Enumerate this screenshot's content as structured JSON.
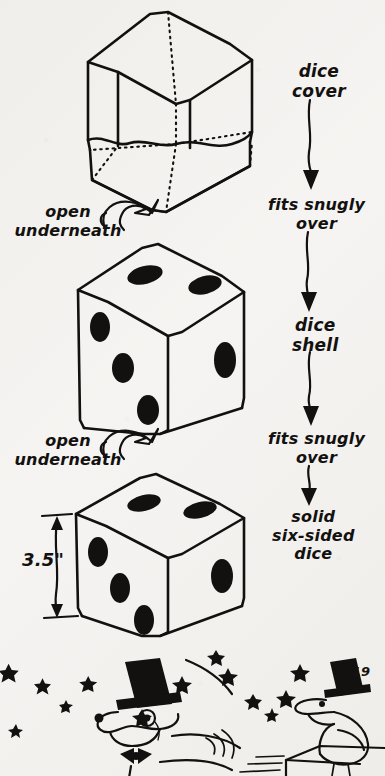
{
  "page": {
    "number": "19",
    "paper_color": "#f3f1ee",
    "ink_color": "#13110f",
    "width": 385,
    "height": 776
  },
  "diagram": {
    "title_implied": "Dice cover / dice shell / solid dice exploded assembly",
    "flow_labels": [
      {
        "id": "dice-cover",
        "text": "dice\ncover",
        "x": 292,
        "y": 62
      },
      {
        "id": "fits-snugly-over-1",
        "text": "fits snugly\nover",
        "x": 272,
        "y": 197
      },
      {
        "id": "dice-shell",
        "text": "dice\nshell",
        "x": 292,
        "y": 316
      },
      {
        "id": "fits-snugly-over-2",
        "text": "fits snugly\nover",
        "x": 272,
        "y": 431
      },
      {
        "id": "solid-six-sided-dice",
        "text": "solid\nsix-sided\ndice",
        "x": 276,
        "y": 510
      }
    ],
    "callouts": [
      {
        "id": "open-underneath-1",
        "text": "open\nunderneath",
        "x": 14,
        "y": 205
      },
      {
        "id": "open-underneath-2",
        "text": "open\nunderneath",
        "x": 14,
        "y": 434
      }
    ],
    "dimension": {
      "id": "height-dimension",
      "text": "3.5\"",
      "x": 26,
      "y": 551,
      "measures": "height of solid six-sided dice"
    },
    "objects": [
      {
        "id": "dice-cover-cube",
        "kind": "hollow-cube-outline",
        "hidden_edges": "dotted",
        "open_side": "underneath",
        "faces": {
          "top": 0,
          "left": 0,
          "right": 0
        }
      },
      {
        "id": "dice-shell-cube",
        "kind": "dice-shell",
        "open_side": "underneath",
        "faces": {
          "top": 2,
          "left": 3,
          "right": 1
        }
      },
      {
        "id": "solid-dice-cube",
        "kind": "solid-dice",
        "faces": {
          "top": 2,
          "left": 3,
          "right": 1
        }
      }
    ],
    "vignette": {
      "id": "bottom-vignette",
      "characters": [
        {
          "id": "dog-in-top-hat",
          "description": "dog wearing top hat, monocle and bow tie"
        },
        {
          "id": "bird-in-top-hat",
          "description": "bird wearing top hat perched on a ledge"
        }
      ],
      "decorations": "scattered hand-drawn stars"
    }
  }
}
